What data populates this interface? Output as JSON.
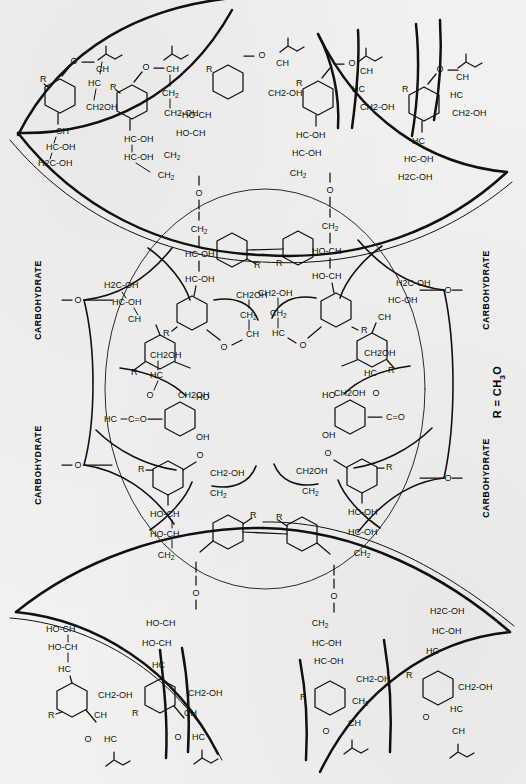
{
  "figure": {
    "domain": "scientific-structure-diagram",
    "type": "radial chemical structure schematic",
    "background_color": "#f2f1ef",
    "ink_color": "#111111",
    "canvas": {
      "width": 526,
      "height": 784
    }
  },
  "legend": {
    "r_definition": "R = CH3O",
    "r_definition_parts": {
      "symbol": "R",
      "equals": "=",
      "group": "CH",
      "sub": "3",
      "tail": "O"
    }
  },
  "labels": {
    "carbohydrate": "CARBOHYDRATE",
    "carbohydrate_positions": [
      {
        "side": "left",
        "index": 1,
        "x": 36,
        "y": 300
      },
      {
        "side": "left",
        "index": 2,
        "x": 36,
        "y": 465
      },
      {
        "side": "right",
        "index": 1,
        "x": 484,
        "y": 290
      },
      {
        "side": "right",
        "index": 2,
        "x": 484,
        "y": 478
      }
    ]
  },
  "atoms": {
    "r": "R",
    "o": "O",
    "oh": "OH",
    "ho": "HO",
    "ch": "CH",
    "hc": "HC",
    "ch2": "CH2",
    "h2c": "H2C",
    "ch2oh": "CH2OH",
    "hc_oh": "HC-OH",
    "ho_ch": "HO-CH",
    "h2c_oh": "H2C-OH",
    "ch2_oh": "CH2-OH",
    "c_eq_o": "C=O"
  },
  "central_ring": {
    "cx": 265,
    "cy": 389,
    "rx": 160,
    "ry": 200,
    "stroke": "#2b2b2b",
    "stroke_width": 1.0,
    "description": "Large thin circle enclosing the inner radial array of sugar units"
  },
  "outer_lenses": {
    "count": 4,
    "stroke_width": 2.5,
    "description": "Four heavy lens/petal arcs at the top-left, top-right, bottom-left and bottom-right corners, formed by pairs of crossing arcs"
  },
  "structure": {
    "repeat_unit": "pyranose ring bearing R substituent, glycosidic O linkage, and an exocyclic polyol chain (CH2-HC-OH-HC-OH-CH2OH)",
    "inner_units": 12,
    "outer_units": 8,
    "linkage_atom": "O",
    "notes": "Units radiate outward from an empty circular core; inner units attach to the circle boundary via O bridges, outer units sit inside the corner lens shapes."
  },
  "fragments": {
    "inner_upper_left": [
      "CH2",
      "HC-OH",
      "HC-OH",
      "R",
      "CH2OH",
      "CH2",
      "CH",
      "O"
    ],
    "inner_upper_right": [
      "CH2",
      "HO-CH",
      "HO-CH",
      "R",
      "CH2-OH",
      "CH2",
      "HC",
      "O"
    ],
    "inner_mid_left": [
      "CH2OH",
      "HC",
      "O",
      "C=O",
      "HC",
      "R",
      "OH",
      "HO"
    ],
    "inner_mid_right": [
      "CH2OH",
      "HC",
      "O",
      "C=O",
      "HC",
      "R",
      "OH",
      "HO"
    ],
    "inner_lower_left": [
      "HO-CH",
      "HO-CH",
      "CH2",
      "O",
      "R",
      "CH2-OH",
      "CH2",
      "HC"
    ],
    "inner_lower_right": [
      "HC-OH",
      "HC-OH",
      "CH2",
      "O",
      "R",
      "CH2OH",
      "CH2",
      "CH"
    ],
    "outer_top_left": [
      "O",
      "CH",
      "HC",
      "CH2OH",
      "R",
      "CH",
      "HC-OH",
      "H2C-OH"
    ],
    "outer_top_mid": [
      "O",
      "CH",
      "CH2",
      "CH2-OH",
      "R",
      "HC-OH",
      "HC-OH",
      "CH2",
      "O"
    ],
    "outer_top_right": [
      "O",
      "CH",
      "HC",
      "CH2-OH",
      "R",
      "HC",
      "HC-OH",
      "H2C-OH"
    ],
    "outer_bottom_left": [
      "HO-CH",
      "HO-CH",
      "HC",
      "R",
      "CH2-OH",
      "CH",
      "HC",
      "O"
    ],
    "outer_bottom_right": [
      "H2C-OH",
      "HC-OH",
      "HC",
      "R",
      "CH2-OH",
      "HC",
      "CH",
      "O"
    ]
  }
}
